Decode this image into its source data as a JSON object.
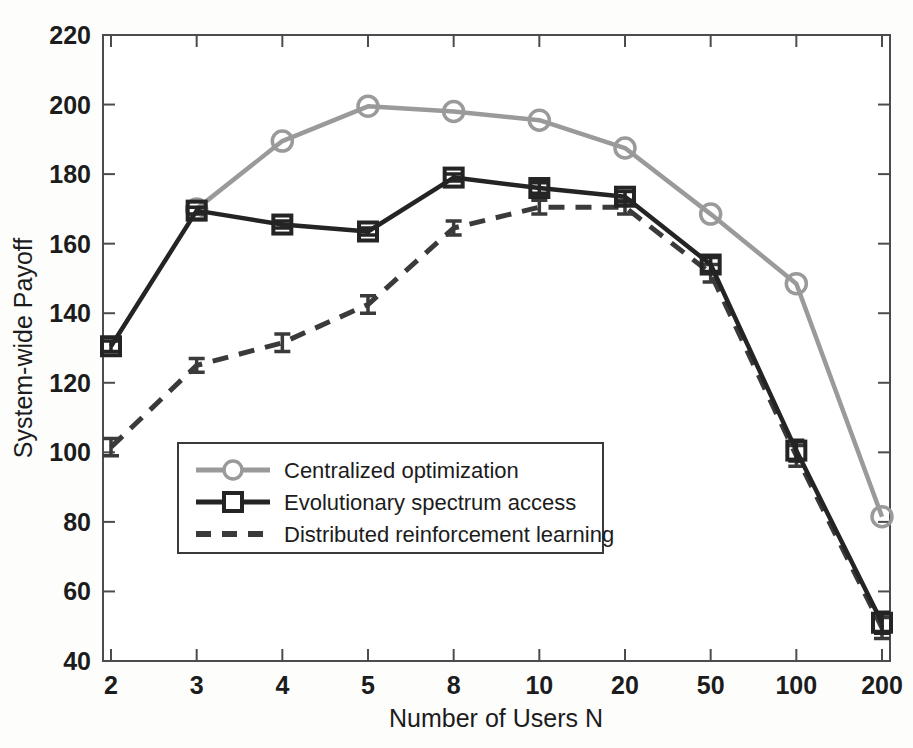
{
  "chart_data": {
    "type": "line",
    "title": "",
    "xlabel": "Number of Users N",
    "ylabel": "System-wide Payoff",
    "categories": [
      "2",
      "3",
      "4",
      "5",
      "8",
      "10",
      "20",
      "50",
      "100",
      "200"
    ],
    "x_tick_labels": [
      "2",
      "3",
      "4",
      "5",
      "8",
      "10",
      "20",
      "50",
      "100",
      "200"
    ],
    "y_tick_labels": [
      "40",
      "60",
      "80",
      "100",
      "120",
      "140",
      "160",
      "180",
      "200",
      "220"
    ],
    "ylim": [
      40,
      220
    ],
    "y_tick_step": 20,
    "grid": false,
    "legend_position": "lower-left-inside",
    "x_scale": "categorical",
    "series": [
      {
        "name": "Centralized optimization",
        "color": "#9a9a9a",
        "marker": "circle",
        "line_style": "solid",
        "values": [
          null,
          170.0,
          189.5,
          199.5,
          198.0,
          195.5,
          187.5,
          168.5,
          148.5,
          81.5
        ],
        "errors": [
          null,
          null,
          null,
          null,
          null,
          null,
          null,
          null,
          null,
          null
        ]
      },
      {
        "name": "Evolutionary spectrum access",
        "color": "#242424",
        "marker": "square",
        "line_style": "solid",
        "values": [
          130.5,
          169.5,
          165.5,
          163.5,
          179.0,
          176.0,
          173.5,
          154.0,
          100.5,
          51.0
        ],
        "errors": [
          1.5,
          1.0,
          1.0,
          1.0,
          1.0,
          1.5,
          1.5,
          2.0,
          3.0,
          3.0
        ]
      },
      {
        "name": "Distributed reinforcement learning",
        "color": "#3a3a3a",
        "marker": "errorbar",
        "line_style": "dashed",
        "values": [
          101.5,
          125.0,
          131.5,
          142.5,
          164.5,
          170.5,
          170.5,
          151.5,
          99.0,
          49.5
        ],
        "errors": [
          2.5,
          2.0,
          2.5,
          2.5,
          2.0,
          2.0,
          2.0,
          2.5,
          3.0,
          3.0
        ]
      }
    ],
    "legend_entries": [
      "Centralized optimization",
      "Evolutionary spectrum access",
      "Distributed reinforcement learning"
    ]
  }
}
